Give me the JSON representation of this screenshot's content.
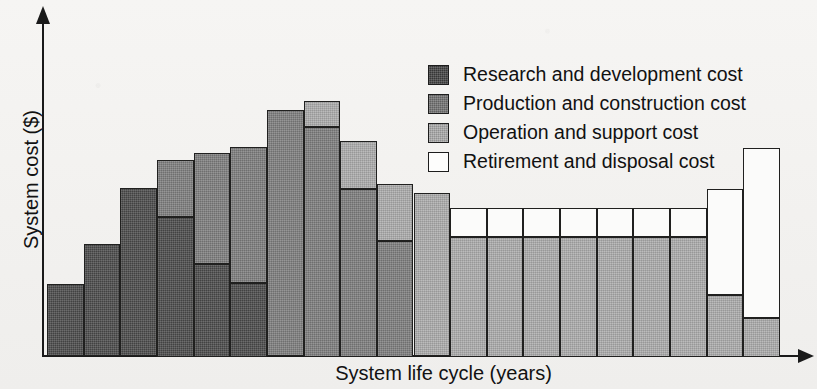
{
  "chart_data": {
    "type": "bar",
    "subtype": "stacked-column",
    "title": "",
    "xlabel": "System life cycle (years)",
    "ylabel": "System cost ($)",
    "grid": false,
    "axis_ticks": false,
    "legend_position": "top-right",
    "x_axis_arrow": true,
    "y_axis_arrow": true,
    "categories": [
      "1",
      "2",
      "3",
      "4",
      "5",
      "6",
      "7",
      "8",
      "9",
      "10",
      "11",
      "12",
      "13",
      "14",
      "15",
      "16",
      "17",
      "18",
      "19",
      "20"
    ],
    "series": [
      {
        "name": "Research and development cost",
        "color": "#4a4a4a",
        "values": [
          72,
          112,
          168,
          140,
          93,
          74,
          0,
          0,
          0,
          0,
          0,
          0,
          0,
          0,
          0,
          0,
          0,
          0,
          0,
          0
        ]
      },
      {
        "name": "Production and construction cost",
        "color": "#7d7d7d",
        "values": [
          0,
          0,
          0,
          57,
          111,
          136,
          246,
          230,
          168,
          116,
          0,
          0,
          0,
          0,
          0,
          0,
          0,
          0,
          0,
          0
        ]
      },
      {
        "name": "Operation and support cost",
        "color": "#ababab",
        "values": [
          0,
          0,
          0,
          0,
          0,
          0,
          0,
          26,
          48,
          57,
          163,
          120,
          120,
          120,
          120,
          120,
          120,
          120,
          62,
          39
        ]
      },
      {
        "name": "Retirement and disposal cost",
        "color": "#fbfbfa",
        "values": [
          0,
          0,
          0,
          0,
          0,
          0,
          0,
          0,
          0,
          0,
          0,
          29,
          29,
          29,
          29,
          29,
          29,
          29,
          106,
          170
        ]
      }
    ],
    "totals": [
      72,
      112,
      168,
      197,
      204,
      210,
      246,
      256,
      216,
      173,
      163,
      149,
      149,
      149,
      149,
      149,
      149,
      149,
      168,
      209
    ],
    "ylim": [
      0,
      336
    ]
  },
  "axes": {
    "x_label": "System life cycle (years)",
    "y_label": "System cost ($)"
  },
  "legend": {
    "items": [
      {
        "label": "Research and development cost",
        "key": "rd"
      },
      {
        "label": "Production and construction cost",
        "key": "pc"
      },
      {
        "label": "Operation and support cost",
        "key": "os"
      },
      {
        "label": "Retirement and disposal cost",
        "key": "rdd"
      }
    ]
  }
}
